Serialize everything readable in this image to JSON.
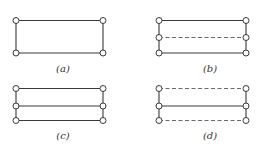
{
  "figure": {
    "colors": {
      "line": "#3a3a3a",
      "dashed_line": "#6a6a6a",
      "node_fill": "#ffffff",
      "node_stroke": "#3a3a3a",
      "background": "#ffffff"
    },
    "panels": [
      {
        "id": "a",
        "label": "(a)",
        "x_left": 16,
        "x_right": 103,
        "rows": [
          20.5,
          53
        ],
        "horizontal_edges": [
          {
            "row": 0,
            "style": "solid"
          },
          {
            "row": 1,
            "style": "solid"
          }
        ],
        "vertical_edges": [
          {
            "side": "left",
            "from": 0,
            "to": 1
          },
          {
            "side": "right",
            "from": 0,
            "to": 1
          }
        ],
        "label_pos": {
          "x": 63,
          "y": 72
        }
      },
      {
        "id": "b",
        "label": "(b)",
        "x_left": 159,
        "x_right": 246,
        "rows": [
          20.5,
          37.5,
          53
        ],
        "horizontal_edges": [
          {
            "row": 0,
            "style": "solid"
          },
          {
            "row": 1,
            "style": "dashed"
          },
          {
            "row": 2,
            "style": "solid"
          }
        ],
        "vertical_edges": [
          {
            "side": "left",
            "from": 0,
            "to": 2
          },
          {
            "side": "right",
            "from": 0,
            "to": 2
          }
        ],
        "label_pos": {
          "x": 210,
          "y": 72
        }
      },
      {
        "id": "c",
        "label": "(c)",
        "x_left": 16,
        "x_right": 103,
        "rows": [
          88.5,
          106,
          120.5
        ],
        "horizontal_edges": [
          {
            "row": 0,
            "style": "solid"
          },
          {
            "row": 1,
            "style": "solid"
          },
          {
            "row": 2,
            "style": "solid"
          }
        ],
        "vertical_edges": [
          {
            "side": "left",
            "from": 0,
            "to": 2
          },
          {
            "side": "right",
            "from": 0,
            "to": 2
          }
        ],
        "label_pos": {
          "x": 63,
          "y": 139
        }
      },
      {
        "id": "d",
        "label": "(d)",
        "x_left": 159,
        "x_right": 246,
        "rows": [
          88.5,
          106,
          120.5
        ],
        "horizontal_edges": [
          {
            "row": 0,
            "style": "dashed"
          },
          {
            "row": 1,
            "style": "solid"
          },
          {
            "row": 2,
            "style": "dashed"
          }
        ],
        "vertical_edges": [
          {
            "side": "left",
            "from": 0,
            "to": 2
          },
          {
            "side": "right",
            "from": 0,
            "to": 2
          }
        ],
        "label_pos": {
          "x": 210,
          "y": 139
        }
      }
    ]
  }
}
